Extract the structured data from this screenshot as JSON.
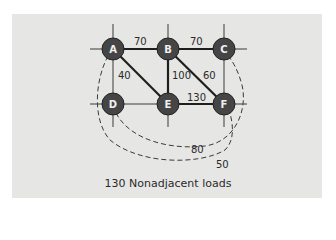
{
  "diagram": {
    "caption": "130 Nonadjacent loads",
    "colors": {
      "panel_bg": "#e6e6e4",
      "node_fill": "#454545",
      "node_ring": "#2a2a2a",
      "node_text": "#f0f0f0",
      "line": "#1e1e1e",
      "grid_line": "#3a3a3a"
    },
    "nodes": [
      {
        "id": "A",
        "label": "A",
        "x": 113,
        "y": 49
      },
      {
        "id": "B",
        "label": "B",
        "x": 168,
        "y": 49
      },
      {
        "id": "C",
        "label": "C",
        "x": 224,
        "y": 49
      },
      {
        "id": "D",
        "label": "D",
        "x": 113,
        "y": 104
      },
      {
        "id": "E",
        "label": "E",
        "x": 168,
        "y": 104
      },
      {
        "id": "F",
        "label": "F",
        "x": 224,
        "y": 104
      }
    ],
    "adjacent_edges": [
      {
        "from": "A",
        "to": "B",
        "load": "70",
        "lx": 140,
        "ly": 45
      },
      {
        "from": "B",
        "to": "C",
        "load": "70",
        "lx": 196,
        "ly": 45
      },
      {
        "from": "A",
        "to": "E",
        "load": "40",
        "lx": 127,
        "ly": 79
      },
      {
        "from": "B",
        "to": "E",
        "load": "100",
        "lx": 183,
        "ly": 79
      },
      {
        "from": "B",
        "to": "F",
        "load": "60",
        "lx": 210,
        "ly": 79
      },
      {
        "from": "E",
        "to": "F",
        "load": "130",
        "lx": 196,
        "ly": 101
      }
    ],
    "nonadjacent_edges": [
      {
        "from": "D",
        "to": "C",
        "load": "80",
        "lx": 196,
        "ly": 153
      },
      {
        "from": "A",
        "to": "F",
        "load": "50",
        "lx": 222,
        "ly": 168
      }
    ],
    "total_nonadjacent_load": "130"
  }
}
